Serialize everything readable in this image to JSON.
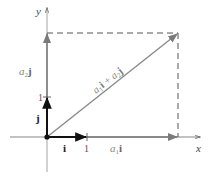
{
  "diagram": {
    "type": "vector-decomposition",
    "axes": {
      "x_label": "x",
      "y_label": "y"
    },
    "unit_vectors": {
      "i_label": "i",
      "j_label": "j"
    },
    "ticks": {
      "x_tick": "1",
      "y_tick": "1"
    },
    "components": {
      "x_component_coef": "a",
      "x_component_sub": "1",
      "x_component_vec": "i",
      "y_component_coef": "a",
      "y_component_sub": "2",
      "y_component_vec": "j"
    },
    "resultant": {
      "a1": "a",
      "sub1": "1",
      "i": "i",
      "plus": " + ",
      "a2": "a",
      "sub2": "2",
      "j": "j"
    },
    "colors": {
      "resultant": "#8a8a8a",
      "component": "#777777",
      "unit_vector": "#111111",
      "axis": "#555555",
      "dashed": "#555555",
      "label_italic": "#888888"
    }
  }
}
